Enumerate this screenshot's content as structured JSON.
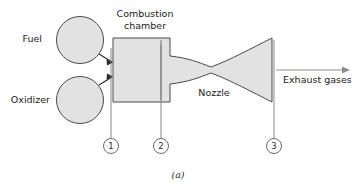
{
  "figure": {
    "caption": "(a)",
    "background_color": "#ffffff",
    "shape_fill_color": "#e2e2e2",
    "shape_stroke_color": "#4a4a4a",
    "leader_line_color": "#7a7a7a"
  },
  "labels": {
    "fuel": "Fuel",
    "oxidizer": "Oxidizer",
    "combustion_chamber_line1": "Combustion",
    "combustion_chamber_line2": "chamber",
    "nozzle": "Nozzle",
    "exhaust_gases": "Exhaust  gases"
  },
  "stations": [
    {
      "number": "1",
      "cx": 111,
      "cy": 146,
      "line_top": 48,
      "line_bottom": 138
    },
    {
      "number": "2",
      "cx": 161,
      "cy": 146,
      "line_top": 45,
      "line_bottom": 138
    },
    {
      "number": "3",
      "cx": 274,
      "cy": 146,
      "line_top": 40,
      "line_bottom": 138
    }
  ],
  "tanks": [
    {
      "name": "fuel-tank",
      "cx": 80,
      "cy": 40,
      "r": 23.5
    },
    {
      "name": "oxidizer-tank",
      "cx": 80,
      "cy": 100,
      "r": 23.5
    }
  ],
  "geometry": {
    "chamber": {
      "x": 113,
      "y": 38,
      "w": 57,
      "h": 64
    },
    "nozzle_throat_x": 211,
    "nozzle_exit_x": 272,
    "exhaust_arrow_y": 70
  }
}
